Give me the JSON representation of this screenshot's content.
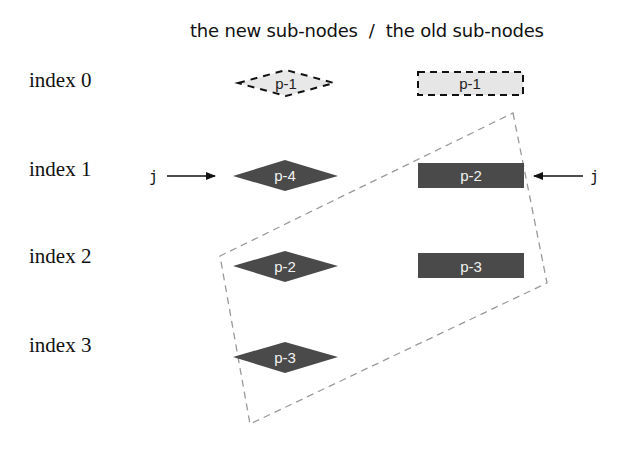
{
  "heading": "the new sub-nodes  /  the old sub-nodes",
  "index_labels": [
    "index 0",
    "index 1",
    "index 2",
    "index 3"
  ],
  "new_subnodes": [
    {
      "index": 0,
      "label": "p-1",
      "style": "ghost-diamond"
    },
    {
      "index": 1,
      "label": "p-4",
      "style": "filled-diamond"
    },
    {
      "index": 2,
      "label": "p-2",
      "style": "filled-diamond"
    },
    {
      "index": 3,
      "label": "p-3",
      "style": "filled-diamond"
    }
  ],
  "old_subnodes": [
    {
      "index": 0,
      "label": "p-1",
      "style": "ghost-rect"
    },
    {
      "index": 1,
      "label": "p-2",
      "style": "filled-rect"
    },
    {
      "index": 2,
      "label": "p-3",
      "style": "filled-rect"
    }
  ],
  "pointers": {
    "new": {
      "label": "j",
      "points_to_index": 1
    },
    "old": {
      "label": "j",
      "points_to_index": 1
    }
  },
  "colors": {
    "node_fill": "#4a4a4a",
    "ghost_fill": "#e6e6e6",
    "dashed_region": "#9a9a9a",
    "text": "#111111"
  }
}
